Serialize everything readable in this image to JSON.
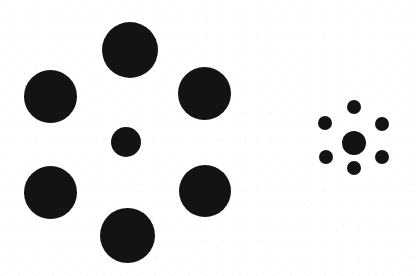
{
  "figure": {
    "name": "Ebbinghaus illusion",
    "alt_name": "Titchener circles",
    "canvas": {
      "width": 420,
      "height": 276
    },
    "background_color": "#ffffff",
    "ink_color": "#131313"
  },
  "chart_data": {
    "type": "scatter",
    "title": "",
    "xlabel": "",
    "ylabel": "",
    "xlim": [
      0,
      420
    ],
    "ylim": [
      276,
      0
    ],
    "grid": false,
    "legend": "none",
    "units": "pixels",
    "marker_shape": "filled-circle",
    "marker_color": "#131313",
    "series": [
      {
        "name": "left-cluster-surrounding",
        "role": "inducer",
        "count": 6,
        "marker_diameter_mean": 54,
        "points": [
          {
            "label": "top",
            "x": 130,
            "y": 50,
            "d": 56
          },
          {
            "label": "upper-left",
            "x": 50,
            "y": 96,
            "d": 53
          },
          {
            "label": "upper-right",
            "x": 204,
            "y": 93,
            "d": 53
          },
          {
            "label": "lower-left",
            "x": 50,
            "y": 192,
            "d": 53
          },
          {
            "label": "lower-right",
            "x": 205,
            "y": 191,
            "d": 52
          },
          {
            "label": "bottom",
            "x": 127,
            "y": 235,
            "d": 55
          }
        ]
      },
      {
        "name": "left-cluster-target",
        "role": "target",
        "count": 1,
        "marker_diameter_mean": 30,
        "points": [
          {
            "label": "center",
            "x": 126,
            "y": 142,
            "d": 30
          }
        ]
      },
      {
        "name": "right-cluster-surrounding",
        "role": "inducer",
        "count": 6,
        "marker_diameter_mean": 14,
        "points": [
          {
            "label": "top",
            "x": 354,
            "y": 107,
            "d": 14
          },
          {
            "label": "upper-left",
            "x": 325,
            "y": 123,
            "d": 14
          },
          {
            "label": "upper-right",
            "x": 382,
            "y": 124,
            "d": 14
          },
          {
            "label": "lower-left",
            "x": 326,
            "y": 157,
            "d": 14
          },
          {
            "label": "lower-right",
            "x": 382,
            "y": 157,
            "d": 14
          },
          {
            "label": "bottom",
            "x": 354,
            "y": 168,
            "d": 14
          }
        ]
      },
      {
        "name": "right-cluster-target",
        "role": "target",
        "count": 1,
        "marker_diameter_mean": 24,
        "points": [
          {
            "label": "center",
            "x": 354,
            "y": 143,
            "d": 24
          }
        ]
      }
    ]
  }
}
